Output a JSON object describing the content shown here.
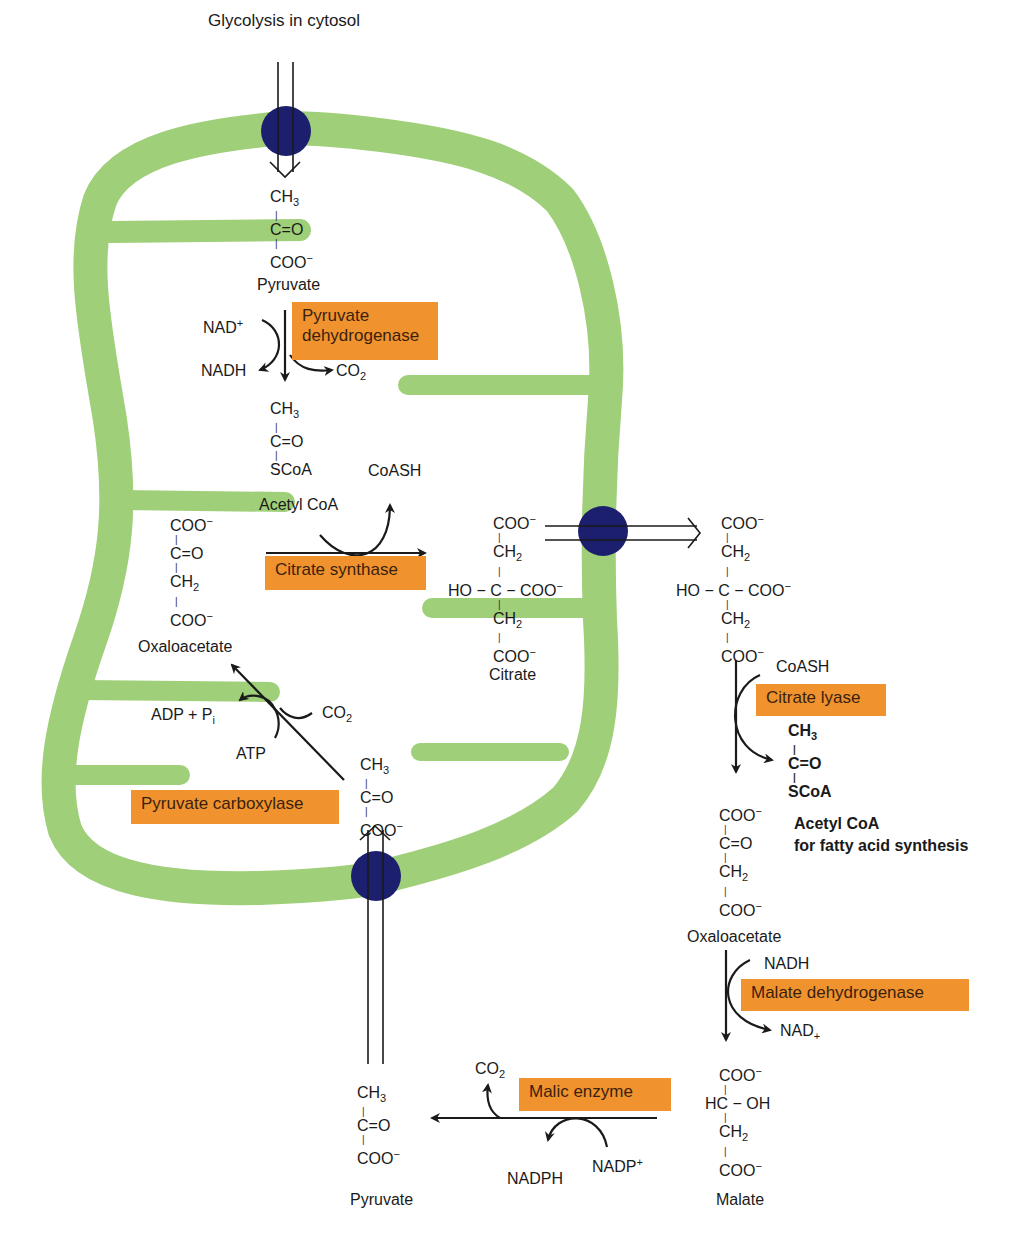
{
  "title": "Glycolysis in cytosol",
  "colors": {
    "membrane": "#9fcf78",
    "transporter": "#1c1f6e",
    "enzyme_box": "#f0932f",
    "arrow": "#1a1a1a"
  },
  "molecules": {
    "pyruvate_top": {
      "l1": "CH",
      "l1_sub": "3",
      "l2": "C=O",
      "l3": "COO",
      "l3_sup": "−",
      "name": "Pyruvate"
    },
    "acetyl_coa_mito": {
      "l1": "CH",
      "l1_sub": "3",
      "l2": "C=O",
      "l3": "SCoA",
      "name": "Acetyl CoA"
    },
    "oxaloacetate_mito": {
      "l1": "COO",
      "l1_sup": "−",
      "l2": "C=O",
      "l3": "CH",
      "l3_sub": "2",
      "l4": "COO",
      "l4_sup": "−",
      "name": "Oxaloacetate"
    },
    "citrate_mito": {
      "l1": "COO",
      "l1_sup": "−",
      "l2": "CH",
      "l2_sub": "2",
      "l3": "HO − C − COO",
      "l3_sup": "−",
      "l4": "CH",
      "l4_sub": "2",
      "l5": "COO",
      "l5_sup": "−",
      "name": "Citrate"
    },
    "citrate_cyto": {
      "l1": "COO",
      "l1_sup": "−",
      "l2": "CH",
      "l2_sub": "2",
      "l3": "HO − C − COO",
      "l3_sup": "−",
      "l4": "CH",
      "l4_sub": "2",
      "l5": "COO",
      "l5_sup": "−"
    },
    "acetyl_coa_cyto": {
      "l1": "CH",
      "l1_sub": "3",
      "l2": "C=O",
      "l3": "SCoA",
      "name1": "Acetyl CoA",
      "name2": "for fatty acid synthesis"
    },
    "oxaloacetate_cyto": {
      "l1": "COO",
      "l1_sup": "−",
      "l2": "C=O",
      "l3": "CH",
      "l3_sub": "2",
      "l4": "COO",
      "l4_sup": "−",
      "name": "Oxaloacetate"
    },
    "malate_cyto": {
      "l1": "COO",
      "l1_sup": "−",
      "l2": "HC − OH",
      "l3": "CH",
      "l3_sub": "2",
      "l4": "COO",
      "l4_sup": "−",
      "name": "Malate"
    },
    "pyruvate_cyto": {
      "l1": "CH",
      "l1_sub": "3",
      "l2": "C=O",
      "l3": "COO",
      "l3_sup": "−",
      "name": "Pyruvate"
    },
    "pyruvate_mito_bottom": {
      "l1": "CH",
      "l1_sub": "3",
      "l2": "C=O",
      "l3": "COO",
      "l3_sup": "−"
    }
  },
  "enzymes": {
    "pyruvate_dehydrogenase": {
      "line1": "Pyruvate",
      "line2": "dehydrogenase"
    },
    "citrate_synthase": "Citrate synthase",
    "citrate_lyase": "Citrate lyase",
    "malate_dehydrogenase": "Malate dehydrogenase",
    "malic_enzyme": "Malic enzyme",
    "pyruvate_carboxylase": "Pyruvate carboxylase"
  },
  "cofactors": {
    "nad_plus": {
      "base": "NAD",
      "sup": "+"
    },
    "nadh_pdh": "NADH",
    "co2_pdh": {
      "base": "CO",
      "sub": "2"
    },
    "coash_cs": "CoASH",
    "coash_lyase": "CoASH",
    "adp_pi": {
      "base": "ADP + P",
      "sub": "i"
    },
    "atp": "ATP",
    "co2_pc": {
      "base": "CO",
      "sub": "2"
    },
    "nadh_mdh": "NADH",
    "nad_mdh": {
      "base": "NAD",
      "sub": "+"
    },
    "co2_me": {
      "base": "CO",
      "sub": "2"
    },
    "nadph": "NADPH",
    "nadp_plus": {
      "base": "NADP",
      "sup": "+"
    }
  }
}
